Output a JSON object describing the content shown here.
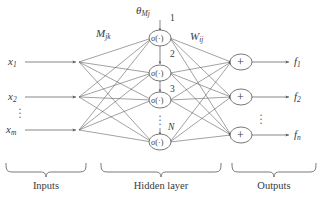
{
  "figure": {
    "type": "neural-network-diagram",
    "background": "#ffffff",
    "ink": "#555555"
  },
  "inputs": {
    "caption": "Inputs",
    "nodes": [
      {
        "base": "x",
        "sub": "1"
      },
      {
        "base": "x",
        "sub": "2"
      },
      {
        "base": "x",
        "sub": "m"
      }
    ],
    "ellipsis": "⋮"
  },
  "hidden": {
    "caption": "Hidden layer",
    "activation": "σ(·)",
    "bias_label": {
      "base": "θ",
      "sub": "Mj"
    },
    "input_weight_label": {
      "base": "M",
      "sub": "jk"
    },
    "output_weight_label": {
      "base": "W",
      "sub": "ij"
    },
    "numbers": [
      "1",
      "2",
      "3",
      "N"
    ],
    "ellipsis": "⋮"
  },
  "outputs": {
    "caption": "Outputs",
    "operator": "+",
    "nodes": [
      {
        "base": "f",
        "sub": "1"
      },
      {
        "base": "f",
        "sub": "2"
      },
      {
        "base": "f",
        "sub": "n"
      }
    ],
    "ellipsis": "⋮"
  }
}
